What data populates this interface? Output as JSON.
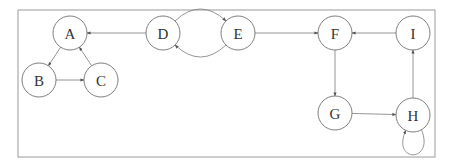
{
  "diagram": {
    "type": "directed-graph",
    "frame": {
      "x": 18,
      "y": 10,
      "width": 417,
      "height": 147
    },
    "node_radius": 17,
    "nodes": [
      {
        "id": "A",
        "label": "A",
        "x": 70,
        "y": 33
      },
      {
        "id": "B",
        "label": "B",
        "x": 39,
        "y": 80
      },
      {
        "id": "C",
        "label": "C",
        "x": 101,
        "y": 80
      },
      {
        "id": "D",
        "label": "D",
        "x": 163,
        "y": 33
      },
      {
        "id": "E",
        "label": "E",
        "x": 238,
        "y": 33
      },
      {
        "id": "F",
        "label": "F",
        "x": 335,
        "y": 33
      },
      {
        "id": "G",
        "label": "G",
        "x": 335,
        "y": 113
      },
      {
        "id": "H",
        "label": "H",
        "x": 413,
        "y": 115
      },
      {
        "id": "I",
        "label": "I",
        "x": 413,
        "y": 33
      }
    ],
    "edges": [
      {
        "from": "A",
        "to": "B",
        "shape": "straight"
      },
      {
        "from": "B",
        "to": "C",
        "shape": "straight"
      },
      {
        "from": "C",
        "to": "A",
        "shape": "straight"
      },
      {
        "from": "D",
        "to": "A",
        "shape": "straight"
      },
      {
        "from": "D",
        "to": "E",
        "shape": "curve-up"
      },
      {
        "from": "E",
        "to": "D",
        "shape": "curve-down"
      },
      {
        "from": "E",
        "to": "F",
        "shape": "straight"
      },
      {
        "from": "F",
        "to": "G",
        "shape": "straight"
      },
      {
        "from": "G",
        "to": "H",
        "shape": "straight"
      },
      {
        "from": "H",
        "to": "H",
        "shape": "self-loop-bottom"
      },
      {
        "from": "H",
        "to": "I",
        "shape": "straight"
      },
      {
        "from": "I",
        "to": "F",
        "shape": "straight"
      }
    ]
  }
}
